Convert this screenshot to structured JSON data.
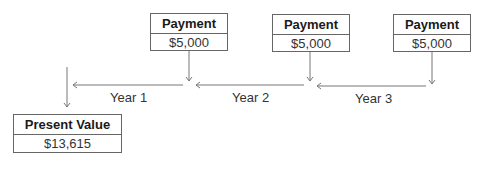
{
  "payments": [
    {
      "title": "Payment",
      "amount": "$5,000"
    },
    {
      "title": "Payment",
      "amount": "$5,000"
    },
    {
      "title": "Payment",
      "amount": "$5,000"
    }
  ],
  "periods": [
    {
      "label": "Year 1"
    },
    {
      "label": "Year 2"
    },
    {
      "label": "Year 3"
    }
  ],
  "present_value": {
    "title": "Present Value",
    "amount": "$13,615"
  },
  "colors": {
    "line": "#777777",
    "border": "#666666"
  }
}
